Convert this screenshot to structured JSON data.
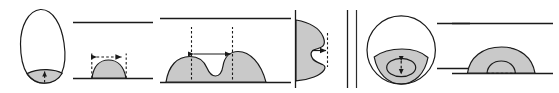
{
  "figure": {
    "canvas": {
      "width": 559,
      "height": 93
    },
    "colors": {
      "fill": "#c9c9c9",
      "stroke": "#1a1a1a",
      "background": "#ffffff",
      "divider": "#2b2b2b"
    },
    "group_divider": {
      "name": "vertical-divider",
      "x": 356,
      "y_top": 10,
      "y_bottom": 88
    },
    "panels": [
      {
        "id": "panel-1",
        "name": "elongated-drop-with-contact-patch",
        "shape": "egg-outline",
        "fill_region": "bottom-contact-patch",
        "annotation": "vertical-dashed-arrow-up",
        "baseline": false
      },
      {
        "id": "panel-2",
        "name": "sessile-cap-on-substrate",
        "shape": "spherical-cap",
        "fill_region": "whole-cap",
        "annotation": "horizontal-double-arrow-width",
        "baseline": true,
        "ceiling": true
      },
      {
        "id": "panel-3",
        "name": "wide-drop-with-central-notch",
        "shape": "twin-lobe-with-dimple",
        "fill_region": "whole-body",
        "annotation": "horizontal-double-arrow-notch-width",
        "baseline": true,
        "ceiling": true
      },
      {
        "id": "panel-4",
        "name": "rotated-drop-on-vertical-wall",
        "shape": "sideways-notched-lobe",
        "fill_region": "whole-body",
        "annotation": "horizontal-arrow-to-dashed-line",
        "baseline": false,
        "wall": true
      },
      {
        "id": "panel-5",
        "name": "circle-with-shaded-contact-lens",
        "shape": "circle-with-chord-segment",
        "fill_region": "lower-segment",
        "inner": "contact-ellipse",
        "annotation": "vertical-dashed-double-arrow",
        "baseline": false
      },
      {
        "id": "panel-6",
        "name": "cap-with-inner-dashed-arc",
        "shape": "spherical-cap",
        "fill_region": "whole-cap",
        "inner": "inner-arc-dashed-base",
        "annotation": "none",
        "baseline": true,
        "ceiling": true
      }
    ]
  }
}
